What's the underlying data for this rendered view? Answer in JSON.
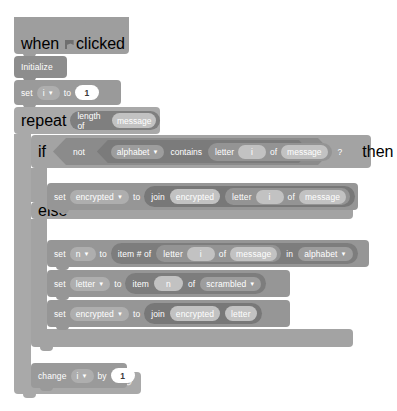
{
  "script": {
    "title": "Scratch-style encryption script",
    "hat": {
      "when": "when",
      "icon": "green-flag-icon",
      "clicked": "clicked"
    },
    "initialize": {
      "label": "Initialize"
    },
    "set_i": {
      "set": "set",
      "variable": "i",
      "to": "to",
      "value": "1"
    },
    "repeat": {
      "label": "repeat",
      "length_of": "length of",
      "operand": "message"
    },
    "if_block": {
      "if": "if",
      "then": "then",
      "else": "else",
      "not": "not",
      "list": "alphabet",
      "contains": "contains",
      "letter": "letter",
      "index": "i",
      "of": "of",
      "string": "message",
      "question": "?"
    },
    "set_encrypted_if": {
      "set": "set",
      "variable": "encrypted",
      "to": "to",
      "join": "join",
      "arg1": "encrypted",
      "letter": "letter",
      "index": "i",
      "of": "of",
      "string": "message"
    },
    "set_n": {
      "set": "set",
      "variable": "n",
      "to": "to",
      "item_num_of": "item # of",
      "letter": "letter",
      "index": "i",
      "of": "of",
      "string": "message",
      "in": "in",
      "list": "alphabet"
    },
    "set_letter": {
      "set": "set",
      "variable": "letter",
      "to": "to",
      "item": "item",
      "index": "n",
      "of": "of",
      "list": "scrambled"
    },
    "set_encrypted_else": {
      "set": "set",
      "variable": "encrypted",
      "to": "to",
      "join": "join",
      "arg1": "encrypted",
      "arg2": "letter"
    },
    "change_i": {
      "change": "change",
      "variable": "i",
      "by": "by",
      "value": "1"
    },
    "loop_arrow": "↺"
  },
  "colors": {
    "background": "#ffffff",
    "control": "#a9a9a9",
    "variable": "#9a9a9a",
    "operator": "#7f7f7f",
    "boolean_outer": "#8b8b8b",
    "boolean_inner": "#7b7b7b",
    "text": "#ffffff",
    "value_oval": "#ffffff"
  }
}
